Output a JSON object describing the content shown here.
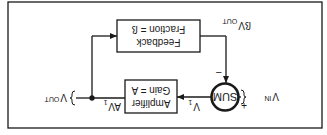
{
  "diagram": {
    "orientation": "rotated-180",
    "stroke_color": "#1a1a1a",
    "background": "#ffffff",
    "blocks": {
      "feedback": {
        "line1": "Feedback",
        "line2": "Fraction = ß"
      },
      "amplifier": {
        "line1": "Amplifier",
        "line2": "Gain = A"
      },
      "sum": {
        "label": "SUM"
      }
    },
    "signals": {
      "vin": {
        "main": "V",
        "sub": "IN"
      },
      "vout": {
        "main": "V",
        "sub": "OUT"
      },
      "v1": {
        "main": "V",
        "sub": "1"
      },
      "av1": {
        "main": "AV",
        "sub": "1"
      },
      "beta_vout": {
        "main": "ßV",
        "sub": "OUT"
      }
    },
    "signs": {
      "plus": "+",
      "minus": "−"
    }
  }
}
